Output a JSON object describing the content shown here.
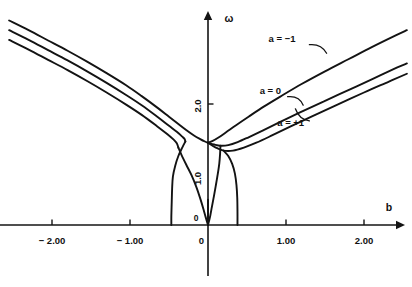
{
  "chart_data": {
    "type": "line",
    "title": "",
    "subtitle": "",
    "xlabel": "b",
    "ylabel": "ω",
    "xlim": [
      -2.55,
      2.55
    ],
    "ylim": [
      0.0,
      3.45
    ],
    "grid": false,
    "legend_position": "inline-annotations",
    "x_ticks": [
      -2.0,
      -1.0,
      0.0,
      1.0,
      2.0
    ],
    "x_tick_labels": [
      "− 2.00",
      "− 1.00",
      "0",
      "1.00",
      "2.00"
    ],
    "y_ticks": [
      1.0,
      2.0
    ],
    "y_tick_labels": [
      "1.0",
      "2.0"
    ],
    "origin_label": "0",
    "annotations": [
      {
        "text": "a = −1",
        "x": 0.95,
        "y": 3.02
      },
      {
        "text": "a = 0",
        "x": 0.8,
        "y": 2.16
      },
      {
        "text": "a = +1",
        "x": 1.06,
        "y": 1.64
      }
    ],
    "series": [
      {
        "name": "a = -1",
        "label": "a = −1",
        "color": "#131313",
        "points_left": [
          [
            -2.55,
            3.38
          ],
          [
            -2.3,
            3.22
          ],
          [
            -2.05,
            3.05
          ],
          [
            -1.8,
            2.88
          ],
          [
            -1.55,
            2.7
          ],
          [
            -1.3,
            2.51
          ],
          [
            -1.05,
            2.31
          ],
          [
            -0.85,
            2.13
          ],
          [
            -0.65,
            1.94
          ],
          [
            -0.5,
            1.79
          ],
          [
            -0.38,
            1.67
          ],
          [
            -0.28,
            1.57
          ],
          [
            -0.18,
            1.48
          ],
          [
            -0.1,
            1.42
          ],
          [
            -0.04,
            1.38
          ],
          [
            0.0,
            1.36
          ]
        ],
        "points_right": [
          [
            0.0,
            1.36
          ],
          [
            0.06,
            1.39
          ],
          [
            0.14,
            1.45
          ],
          [
            0.24,
            1.54
          ],
          [
            0.36,
            1.65
          ],
          [
            0.52,
            1.79
          ],
          [
            0.72,
            1.96
          ],
          [
            0.95,
            2.14
          ],
          [
            1.2,
            2.33
          ],
          [
            1.5,
            2.54
          ],
          [
            1.8,
            2.74
          ],
          [
            2.1,
            2.94
          ],
          [
            2.4,
            3.13
          ],
          [
            2.55,
            3.22
          ]
        ]
      },
      {
        "name": "a = 0",
        "label": "a = 0",
        "color": "#131313",
        "points_left": [
          [
            -2.55,
            3.22
          ],
          [
            -2.3,
            3.06
          ],
          [
            -2.05,
            2.89
          ],
          [
            -1.8,
            2.72
          ],
          [
            -1.55,
            2.54
          ],
          [
            -1.3,
            2.35
          ],
          [
            -1.05,
            2.15
          ],
          [
            -0.85,
            1.98
          ],
          [
            -0.65,
            1.79
          ],
          [
            -0.5,
            1.64
          ],
          [
            -0.4,
            1.54
          ],
          [
            -0.33,
            1.46
          ],
          [
            -0.3,
            1.42
          ],
          [
            -0.29,
            1.38
          ]
        ],
        "points_right": [
          [
            0.0,
            1.36
          ],
          [
            0.08,
            1.33
          ],
          [
            0.16,
            1.31
          ],
          [
            0.26,
            1.32
          ],
          [
            0.38,
            1.37
          ],
          [
            0.52,
            1.45
          ],
          [
            0.7,
            1.56
          ],
          [
            0.92,
            1.7
          ],
          [
            1.18,
            1.86
          ],
          [
            1.48,
            2.04
          ],
          [
            1.8,
            2.23
          ],
          [
            2.12,
            2.42
          ],
          [
            2.42,
            2.6
          ],
          [
            2.55,
            2.67
          ]
        ]
      },
      {
        "name": "a = +1",
        "label": "a = +1",
        "color": "#131313",
        "points_left": [
          [
            -2.55,
            3.06
          ],
          [
            -2.3,
            2.9
          ],
          [
            -2.05,
            2.73
          ],
          [
            -1.8,
            2.56
          ],
          [
            -1.55,
            2.38
          ],
          [
            -1.3,
            2.19
          ],
          [
            -1.05,
            1.99
          ],
          [
            -0.85,
            1.82
          ],
          [
            -0.65,
            1.63
          ],
          [
            -0.52,
            1.5
          ],
          [
            -0.44,
            1.41
          ],
          [
            -0.4,
            1.35
          ],
          [
            -0.38,
            1.28
          ]
        ],
        "points_right": [
          [
            0.0,
            1.36
          ],
          [
            0.1,
            1.28
          ],
          [
            0.2,
            1.23
          ],
          [
            0.32,
            1.23
          ],
          [
            0.46,
            1.28
          ],
          [
            0.62,
            1.36
          ],
          [
            0.82,
            1.48
          ],
          [
            1.06,
            1.63
          ],
          [
            1.34,
            1.8
          ],
          [
            1.66,
            1.99
          ],
          [
            2.0,
            2.19
          ],
          [
            2.32,
            2.37
          ],
          [
            2.55,
            2.5
          ]
        ]
      }
    ],
    "lower_branches": [
      {
        "name": "left-outer-descending",
        "points": [
          [
            -0.29,
            1.38
          ],
          [
            -0.33,
            1.28
          ],
          [
            -0.38,
            1.14
          ],
          [
            -0.42,
            0.98
          ],
          [
            -0.45,
            0.8
          ],
          [
            -0.46,
            0.6
          ],
          [
            -0.465,
            0.38
          ],
          [
            -0.47,
            0.15
          ],
          [
            -0.47,
            0.0
          ]
        ]
      },
      {
        "name": "right-outer-descending",
        "points": [
          [
            0.2,
            1.23
          ],
          [
            0.26,
            1.14
          ],
          [
            0.31,
            1.01
          ],
          [
            0.345,
            0.85
          ],
          [
            0.365,
            0.66
          ],
          [
            0.375,
            0.45
          ],
          [
            0.378,
            0.22
          ],
          [
            0.378,
            0.0
          ]
        ]
      },
      {
        "name": "left-inner-descending",
        "points": [
          [
            -0.38,
            1.28
          ],
          [
            -0.34,
            1.16
          ],
          [
            -0.28,
            1.0
          ],
          [
            -0.21,
            0.82
          ],
          [
            -0.15,
            0.63
          ],
          [
            -0.1,
            0.44
          ],
          [
            -0.06,
            0.27
          ],
          [
            -0.03,
            0.13
          ],
          [
            -0.01,
            0.04
          ],
          [
            0.0,
            0.0
          ]
        ]
      },
      {
        "name": "right-inner-descending",
        "points": [
          [
            0.16,
            1.31
          ],
          [
            0.155,
            1.18
          ],
          [
            0.145,
            1.02
          ],
          [
            0.125,
            0.84
          ],
          [
            0.1,
            0.65
          ],
          [
            0.075,
            0.47
          ],
          [
            0.05,
            0.3
          ],
          [
            0.03,
            0.16
          ],
          [
            0.012,
            0.06
          ],
          [
            0.0,
            0.0
          ]
        ]
      },
      {
        "name": "center-stem",
        "points": [
          [
            0.0,
            0.42
          ],
          [
            0.0,
            0.0
          ]
        ]
      }
    ]
  }
}
